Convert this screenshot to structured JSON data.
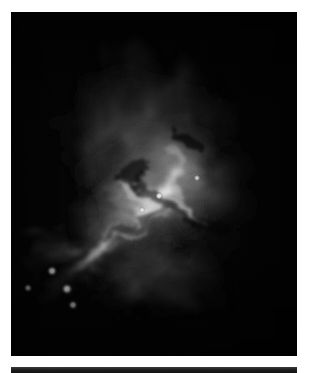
{
  "page": {
    "background_color": "#ffffff",
    "width": 313,
    "height": 373
  },
  "figure": {
    "name": "astronomical-nebula-image",
    "kind": "grayscale-astronomical-photograph",
    "colorization": "monochrome-grayscale",
    "background_color": "#030303",
    "peak_color": "#f2f2f2",
    "frame": {
      "x": 11,
      "y": 12,
      "width": 286,
      "height": 344
    },
    "point_sources": [
      {
        "name": "star-1",
        "cx": 41,
        "cy": 259,
        "r": 2.6,
        "brightness": 0.95
      },
      {
        "name": "star-2",
        "cx": 17,
        "cy": 276,
        "r": 2.2,
        "brightness": 0.88
      },
      {
        "name": "star-3",
        "cx": 56,
        "cy": 277,
        "r": 2.8,
        "brightness": 1.0
      },
      {
        "name": "star-4",
        "cx": 62,
        "cy": 293,
        "r": 2.4,
        "brightness": 0.92
      },
      {
        "name": "star-5",
        "cx": 148,
        "cy": 184,
        "r": 2.0,
        "brightness": 0.9
      },
      {
        "name": "star-6",
        "cx": 186,
        "cy": 166,
        "r": 1.8,
        "brightness": 0.85
      },
      {
        "name": "star-7",
        "cx": 131,
        "cy": 198,
        "r": 1.6,
        "brightness": 0.8
      }
    ]
  },
  "figure_next": {
    "name": "next-figure-panel-sliver",
    "kind": "grayscale-astronomical-photograph",
    "background_color": "#1a1a1a",
    "frame": {
      "x": 11,
      "y": 367,
      "width": 286,
      "height": 6
    },
    "alt_text": "Top edge of a following dark image panel, cropped by the page boundary."
  }
}
